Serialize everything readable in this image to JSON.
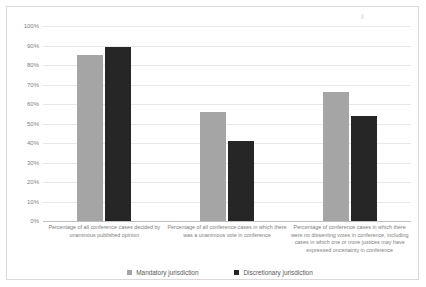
{
  "chart_data": {
    "type": "bar",
    "title": "",
    "subtitle": "",
    "xlabel": "",
    "ylabel": "",
    "ylim": [
      0,
      100
    ],
    "ytick_labels": [
      "100%",
      "90%",
      "80%",
      "70%",
      "60%",
      "50%",
      "40%",
      "30%",
      "20%",
      "10%",
      "0%"
    ],
    "ytick_values": [
      100,
      90,
      80,
      70,
      60,
      50,
      40,
      30,
      20,
      10,
      0
    ],
    "grid": true,
    "legend_position": "bottom",
    "value_suffix": "%",
    "categories": [
      "Percentage of all conference cases decided by unanimous published opinion",
      "Percentage of all conference cases in which there was a unanimous vote in conference",
      "Percentage of conference cases in which there were no dissenting votes in conference, including cases in which one or more justices may have expressed uncertainty in conference"
    ],
    "series": [
      {
        "name": "Mandatory jurisdiction",
        "color": "#a5a5a5",
        "values": [
          85,
          56,
          66
        ]
      },
      {
        "name": "Discretionary jurisdiction",
        "color": "#262626",
        "values": [
          89,
          41,
          54
        ]
      }
    ]
  },
  "legend": {
    "items": [
      {
        "label": "Mandatory jurisdiction"
      },
      {
        "label": "Discretionary jurisdiction"
      }
    ]
  }
}
